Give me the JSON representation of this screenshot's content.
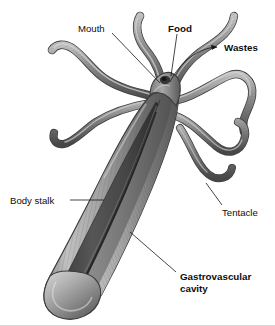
{
  "figure": {
    "background_color": "#ffffff",
    "style": "grayscale scientific illustration"
  },
  "labels": [
    {
      "id": "mouth",
      "text": "Mouth",
      "weight": "regular",
      "x": 78,
      "y": 29,
      "anchor": "start",
      "leader": "diagonal-line-down-right",
      "points_to": "mouth opening at top of body stalk"
    },
    {
      "id": "food",
      "text": "Food",
      "weight": "bold",
      "x": 168,
      "y": 29,
      "anchor": "start",
      "leader": "vertical-line-down",
      "points_to": "mouth opening"
    },
    {
      "id": "wastes",
      "text": "Wastes",
      "weight": "bold",
      "x": 224,
      "y": 51,
      "anchor": "start",
      "leader": "curved-arrow",
      "points_to": "away from mouth, outward"
    },
    {
      "id": "body-stalk",
      "text": "Body stalk",
      "weight": "regular",
      "x": 10,
      "y": 203,
      "anchor": "start",
      "leader": "horizontal-line-right",
      "points_to": "body wall of stalk"
    },
    {
      "id": "tentacle",
      "text": "Tentacle",
      "weight": "regular",
      "x": 222,
      "y": 215,
      "anchor": "start",
      "leader": "diagonal-line-up-left",
      "points_to": "tentacle arm"
    },
    {
      "id": "gastrovascular-cavity",
      "text": "Gastrovascular",
      "text_line2": "cavity",
      "weight": "bold",
      "x": 180,
      "y": 279,
      "anchor": "start",
      "leader": "diagonal-line-up-left",
      "points_to": "interior cavity of body stalk"
    }
  ],
  "colors": {
    "outline": "#3a3a3a",
    "body_light": "#c9c9c9",
    "body_mid": "#9a9a9a",
    "body_dark": "#5e5e5e",
    "cavity_dark": "#4a4a4a",
    "cavity_deep": "#2e2e2e",
    "tentacle_light": "#b8b8b8",
    "tentacle_dark": "#606060",
    "label_text": "#0d0d0d",
    "leader_line": "#171717",
    "frame": "#d8d8d8"
  },
  "anatomy": {
    "tentacle_count": 7,
    "parts": [
      "mouth",
      "tentacle",
      "body stalk",
      "gastrovascular cavity",
      "basal disc"
    ]
  }
}
